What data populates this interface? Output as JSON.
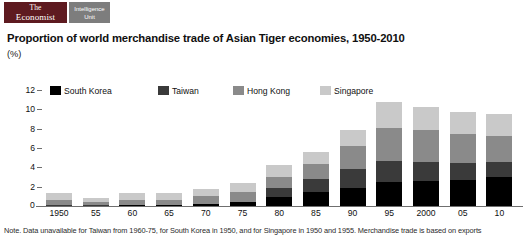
{
  "masthead": {
    "economist_line1": "The",
    "economist_line2": "Economist",
    "eiu_line1": "Intelligence",
    "eiu_line2": "Unit",
    "economist_bg": "#5e1a20",
    "eiu_bg": "#7d7d7d"
  },
  "headline": "Proportion of world merchandise trade of Asian Tiger economies, 1950-2010",
  "unit_label": "(%)",
  "zero_label": "0",
  "footnote": "Note. Data unavailable for Taiwan from 1960-75, for South Korea in 1950, and for Singapore in 1950 and 1955. Merchandise trade is based on exports",
  "chart_data": {
    "type": "bar",
    "title": "Proportion of world merchandise trade of Asian Tiger economies, 1950-2010",
    "subtitle": "(%)",
    "xlabel": "",
    "ylabel": "(%)",
    "ylim": [
      0,
      12
    ],
    "yticks": [
      2,
      4,
      6,
      8,
      10,
      12
    ],
    "grid": false,
    "legend_position": "top-left",
    "stacked": true,
    "categories": [
      "1950",
      "55",
      "60",
      "65",
      "70",
      "75",
      "80",
      "85",
      "90",
      "95",
      "2000",
      "05",
      "10"
    ],
    "series": [
      {
        "name": "South Korea",
        "color": "#000000",
        "values": [
          0,
          0,
          0.1,
          0.1,
          0.2,
          0.4,
          0.9,
          1.4,
          1.9,
          2.5,
          2.6,
          2.7,
          3.0
        ]
      },
      {
        "name": "Taiwan",
        "color": "#3a3a3a",
        "values": [
          0.1,
          0.1,
          0,
          0,
          0,
          0,
          1.0,
          1.4,
          1.9,
          2.2,
          2.0,
          1.7,
          1.6
        ]
      },
      {
        "name": "Hong Kong",
        "color": "#8a8a8a",
        "values": [
          0.5,
          0.3,
          0.5,
          0.5,
          0.8,
          1.0,
          1.1,
          1.5,
          2.4,
          3.4,
          3.3,
          3.0,
          2.6
        ]
      },
      {
        "name": "Singapore",
        "color": "#c9c9c9",
        "values": [
          0.8,
          0.4,
          0.7,
          0.7,
          0.8,
          1.0,
          1.2,
          1.3,
          1.7,
          2.7,
          2.3,
          2.3,
          2.3
        ]
      }
    ],
    "totals": [
      1.4,
      0.8,
      1.3,
      1.3,
      1.8,
      2.4,
      4.2,
      5.6,
      7.9,
      10.8,
      10.2,
      9.7,
      9.5
    ]
  }
}
